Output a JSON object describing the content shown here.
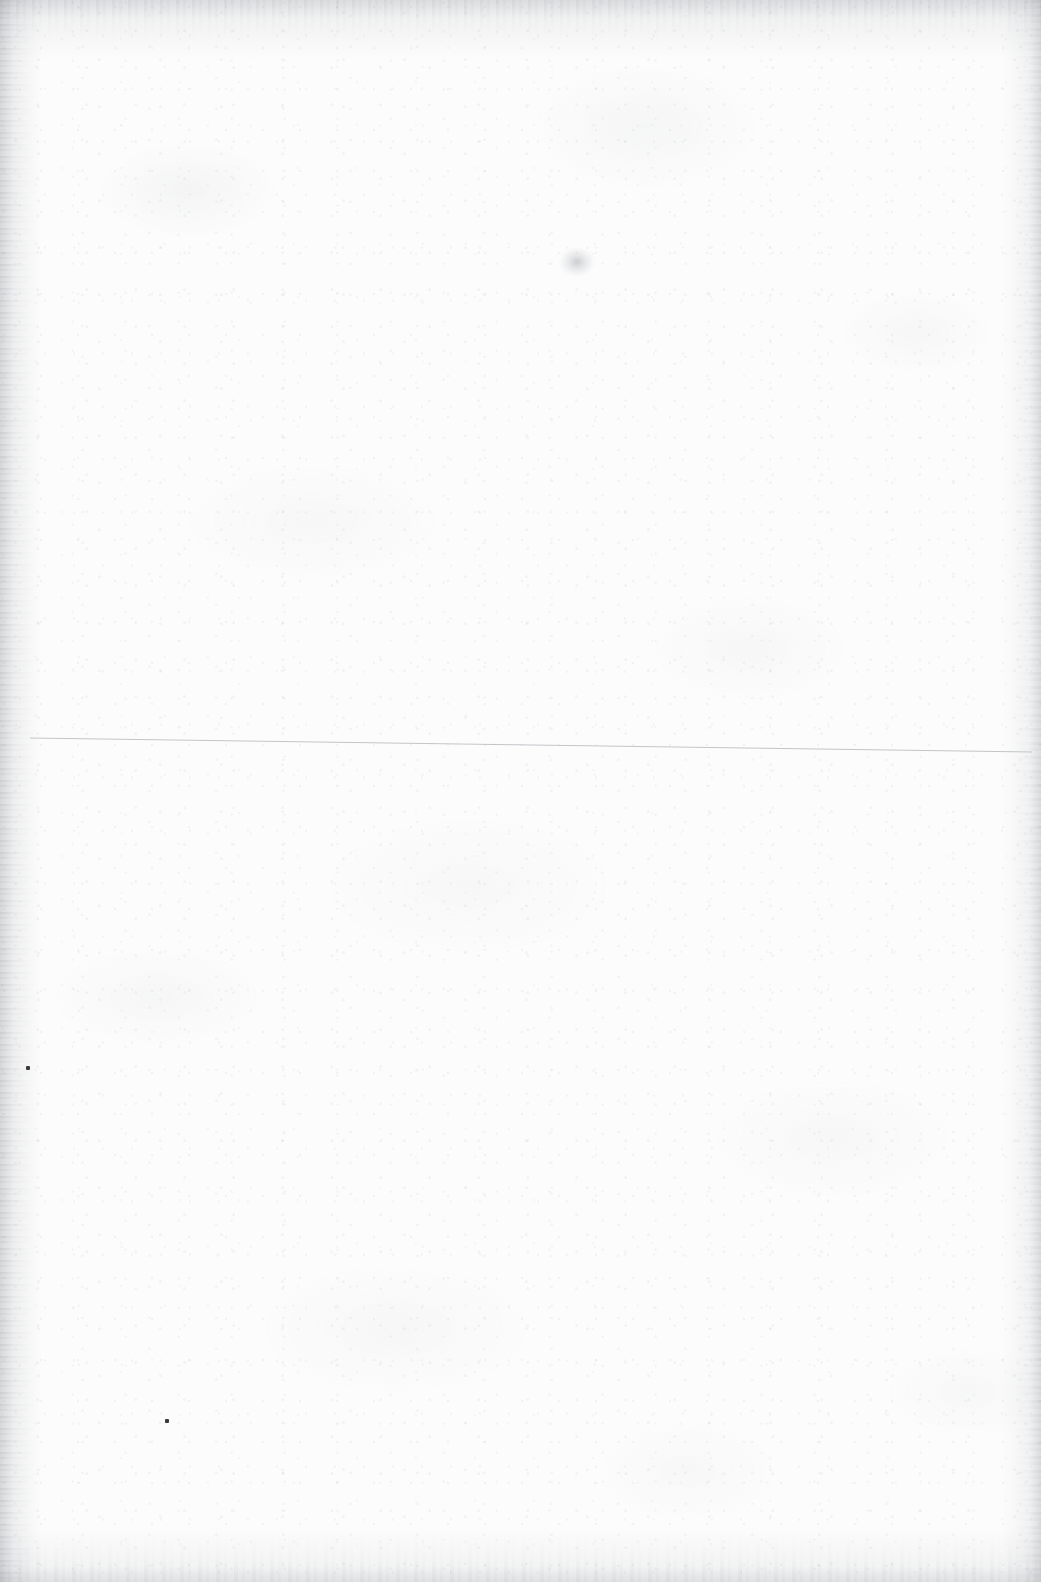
{
  "page": {
    "kind": "scanned-blank-page",
    "width": 1041,
    "height": 1582,
    "caption": "Scanned blank page with paper grain, one faint horizontal rule and a few small ink specks.",
    "text_content": "",
    "colors": {
      "paper": "#fcfcfc",
      "grain": "#969ba2",
      "edge_shadow": "#80858c",
      "rule_line": "#b8bcc0",
      "ink_dot": "#3a3a3c",
      "smudge": "#787e86"
    }
  },
  "marks": {
    "rule_line": {
      "name": "horizontal-rule",
      "x_start": 30,
      "y_start": 738,
      "x_end": 1032,
      "y_end": 752,
      "stroke_width": 1,
      "color": "#b8bcc0",
      "opacity": 0.85
    },
    "ink_dots": [
      {
        "name": "ink-dot-upper-left",
        "x": 26,
        "y": 1066,
        "size": 4
      },
      {
        "name": "ink-dot-lower-left",
        "x": 165,
        "y": 1419,
        "size": 4
      }
    ],
    "smudges": [
      {
        "name": "pencil-smudge-top-center",
        "x": 560,
        "y": 248,
        "width": 34,
        "height": 28
      }
    ]
  }
}
